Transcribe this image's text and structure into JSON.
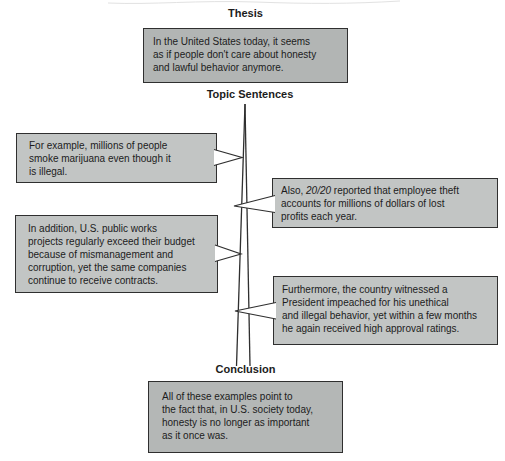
{
  "headings": {
    "thesis": "Thesis",
    "topic_sentences": "Topic Sentences",
    "conclusion": "Conclusion"
  },
  "boxes": {
    "thesis": {
      "lines": [
        "In the United States today, it seems",
        "as if people don't care about honesty",
        "and lawful behavior anymore."
      ]
    },
    "topic1_left": {
      "lines": [
        "For example, millions of people",
        "smoke marijuana even though it",
        "is illegal."
      ]
    },
    "topic2_right": {
      "line1_prefix": "Also, ",
      "line1_italic": "20/20",
      "line1_suffix": " reported that employee theft",
      "line2": "accounts for millions of dollars of lost",
      "line3": "profits each year."
    },
    "topic3_left": {
      "lines": [
        "In addition, U.S. public works",
        "projects regularly exceed their budget",
        "because of mismanagement and",
        "corruption, yet the same companies",
        "continue to receive contracts."
      ]
    },
    "topic4_right": {
      "lines": [
        "Furthermore, the country witnessed a",
        "President impeached for his unethical",
        "and illegal behavior, yet within a few months",
        "he again received high approval ratings."
      ]
    },
    "conclusion": {
      "lines": [
        "All of these examples point to",
        "the fact that, in U.S. society today,",
        "honesty is no longer as important",
        "as it once was."
      ]
    }
  },
  "colors": {
    "thesis_box_fill": "#b2b5b4",
    "side_box_fill": "#c2c5c4",
    "conclusion_box_fill": "#b4b7b6",
    "box_border": "#2f2f2f",
    "text": "#1c1c1c",
    "connector_line": "#2f2f2f",
    "pointer_fill": "#ffffff",
    "background": "#ffffff"
  }
}
